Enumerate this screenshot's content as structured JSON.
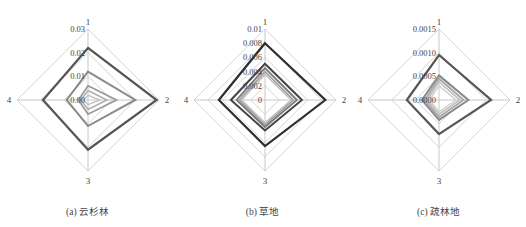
{
  "chart_data": [
    {
      "type": "radar",
      "title": "(a) 云杉林",
      "axes": [
        "1",
        "2",
        "3",
        "4"
      ],
      "max": 0.03,
      "ticks": [
        "0.00",
        "0.01",
        "0.02",
        "0.03"
      ],
      "tick_values": [
        0,
        0.01,
        0.02,
        0.03
      ],
      "series": [
        {
          "name": "s1",
          "color": "#555555",
          "width": 2.2,
          "values": [
            0.022,
            0.029,
            0.021,
            0.019
          ]
        },
        {
          "name": "s2",
          "color": "#8a8a8a",
          "width": 2.0,
          "values": [
            0.012,
            0.02,
            0.011,
            0.009
          ]
        },
        {
          "name": "s3",
          "color": "#9a9a9a",
          "width": 1.8,
          "values": [
            0.006,
            0.012,
            0.006,
            0.004
          ]
        },
        {
          "name": "s4",
          "color": "#b0b0b0",
          "width": 1.6,
          "values": [
            0.004,
            0.008,
            0.004,
            0.003
          ]
        },
        {
          "name": "s5",
          "color": "#c4c4c4",
          "width": 1.5,
          "values": [
            0.002,
            0.005,
            0.002,
            0.002
          ]
        }
      ]
    },
    {
      "type": "radar",
      "title": "(b) 草地",
      "axes": [
        "1",
        "2",
        "3",
        "4"
      ],
      "max": 0.01,
      "ticks": [
        "0",
        "0.002",
        "0.004",
        "0.006",
        "0.008",
        "0.01"
      ],
      "tick_values": [
        0,
        0.002,
        0.004,
        0.006,
        0.008,
        0.01
      ],
      "series": [
        {
          "name": "s1",
          "color": "#2e2e2e",
          "width": 2.2,
          "values": [
            0.008,
            0.0085,
            0.0065,
            0.0065
          ]
        },
        {
          "name": "s2",
          "color": "#444444",
          "width": 2.0,
          "values": [
            0.0051,
            0.0052,
            0.0043,
            0.0048
          ]
        },
        {
          "name": "s3",
          "color": "#7a7a7a",
          "width": 1.8,
          "values": [
            0.0045,
            0.0045,
            0.0038,
            0.004
          ]
        },
        {
          "name": "s4",
          "color": "#a0a0a0",
          "width": 1.6,
          "values": [
            0.004,
            0.004,
            0.0035,
            0.0036
          ]
        },
        {
          "name": "s5",
          "color": "#c0c0c0",
          "width": 1.5,
          "values": [
            0.0036,
            0.0037,
            0.0032,
            0.0033
          ]
        }
      ]
    },
    {
      "type": "radar",
      "title": "(c) 疏林地",
      "axes": [
        "1",
        "2",
        "3",
        "4"
      ],
      "max": 0.0015,
      "ticks": [
        "0.0000",
        "0.0005",
        "0.0010",
        "0.0015"
      ],
      "tick_values": [
        0,
        0.0005,
        0.001,
        0.0015
      ],
      "series": [
        {
          "name": "s1",
          "color": "#555555",
          "width": 2.2,
          "values": [
            0.00095,
            0.0011,
            0.00072,
            0.00068
          ]
        },
        {
          "name": "s2",
          "color": "#8a8a8a",
          "width": 2.0,
          "values": [
            0.00052,
            0.00062,
            0.00042,
            0.00036
          ]
        },
        {
          "name": "s3",
          "color": "#a8a8a8",
          "width": 1.8,
          "values": [
            0.00045,
            0.00052,
            0.00036,
            0.0003
          ]
        },
        {
          "name": "s4",
          "color": "#bdbdbd",
          "width": 1.6,
          "values": [
            0.00038,
            0.00044,
            0.0003,
            0.00025
          ]
        },
        {
          "name": "s5",
          "color": "#d0d0d0",
          "width": 1.5,
          "values": [
            0.0003,
            0.00036,
            0.00025,
            0.0002
          ]
        }
      ]
    }
  ],
  "captions": [
    "(a) 云杉林",
    "(b) 草地",
    "(c) 疏林地"
  ],
  "grid_color": "#d6d6d6",
  "axis_color": "#c8c8c8"
}
